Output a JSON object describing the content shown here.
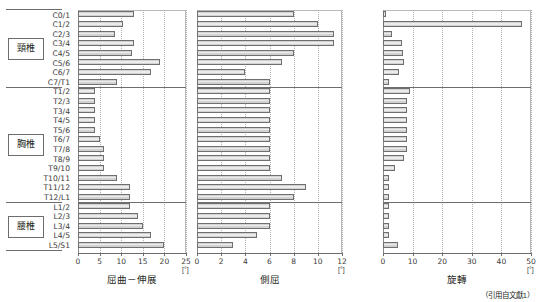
{
  "figure": {
    "citation": "（引用自文獻1）",
    "unit_symbol": "[°]"
  },
  "groups": [
    {
      "name": "cervical",
      "label": "頸椎"
    },
    {
      "name": "thoracic",
      "label": "胸椎"
    },
    {
      "name": "lumbar",
      "label": "腰椎"
    }
  ],
  "levels": [
    "C0/1",
    "C1/2",
    "C2/3",
    "C3/4",
    "C4/5",
    "C5/6",
    "C6/7",
    "C7/T1",
    "T1/2",
    "T2/3",
    "T3/4",
    "T4/5",
    "T5/6",
    "T6/7",
    "T7/8",
    "T8/9",
    "T9/10",
    "T10/11",
    "T11/12",
    "T12/L1",
    "L1/2",
    "L2/3",
    "L3/4",
    "L4/5",
    "L5/S1"
  ],
  "chart_data": [
    {
      "type": "bar",
      "orientation": "horizontal",
      "title": "屈曲－伸展",
      "xlabel": "屈曲－伸展",
      "ylabel": "",
      "unit": "[°]",
      "xlim": [
        0,
        25
      ],
      "xticks": [
        0,
        5,
        10,
        15,
        20,
        25
      ],
      "grid": true,
      "categories": [
        "C0/1",
        "C1/2",
        "C2/3",
        "C3/4",
        "C4/5",
        "C5/6",
        "C6/7",
        "C7/T1",
        "T1/2",
        "T2/3",
        "T3/4",
        "T4/5",
        "T5/6",
        "T6/7",
        "T7/8",
        "T8/9",
        "T9/10",
        "T10/11",
        "T11/12",
        "T12/L1",
        "L1/2",
        "L2/3",
        "L3/4",
        "L4/5",
        "L5/S1"
      ],
      "values": [
        13.0,
        10.5,
        8.5,
        13.0,
        12.5,
        19.0,
        17.0,
        9.0,
        4.0,
        4.0,
        4.0,
        4.0,
        4.0,
        5.0,
        6.0,
        6.0,
        6.0,
        9.0,
        12.0,
        12.0,
        12.0,
        14.0,
        15.0,
        17.0,
        20.0
      ]
    },
    {
      "type": "bar",
      "orientation": "horizontal",
      "title": "側屈",
      "xlabel": "側屈",
      "ylabel": "",
      "unit": "[°]",
      "xlim": [
        0,
        12
      ],
      "xticks": [
        0,
        2,
        4,
        6,
        8,
        10,
        12
      ],
      "grid": true,
      "categories": [
        "C0/1",
        "C1/2",
        "C2/3",
        "C3/4",
        "C4/5",
        "C5/6",
        "C6/7",
        "C7/T1",
        "T1/2",
        "T2/3",
        "T3/4",
        "T4/5",
        "T5/6",
        "T6/7",
        "T7/8",
        "T8/9",
        "T9/10",
        "T10/11",
        "T11/12",
        "T12/L1",
        "L1/2",
        "L2/3",
        "L3/4",
        "L4/5",
        "L5/S1"
      ],
      "values": [
        8.0,
        10.0,
        11.3,
        11.3,
        8.0,
        7.0,
        4.0,
        6.0,
        6.0,
        6.0,
        6.0,
        6.0,
        6.0,
        6.0,
        6.0,
        6.0,
        6.0,
        7.0,
        9.0,
        8.0,
        6.0,
        6.0,
        6.0,
        5.0,
        3.0
      ]
    },
    {
      "type": "bar",
      "orientation": "horizontal",
      "title": "旋轉",
      "xlabel": "旋轉",
      "ylabel": "",
      "unit": "[°]",
      "xlim": [
        0,
        50
      ],
      "xticks": [
        0,
        10,
        20,
        30,
        40,
        50
      ],
      "grid": true,
      "categories": [
        "C0/1",
        "C1/2",
        "C2/3",
        "C3/4",
        "C4/5",
        "C5/6",
        "C6/7",
        "C7/T1",
        "T1/2",
        "T2/3",
        "T3/4",
        "T4/5",
        "T5/6",
        "T6/7",
        "T7/8",
        "T8/9",
        "T9/10",
        "T10/11",
        "T11/12",
        "T12/L1",
        "L1/2",
        "L2/3",
        "L3/4",
        "L4/5",
        "L5/S1"
      ],
      "values": [
        1.0,
        47.0,
        3.0,
        6.5,
        6.8,
        7.0,
        5.4,
        2.0,
        9.0,
        8.0,
        8.0,
        8.0,
        8.0,
        8.0,
        8.0,
        7.0,
        4.0,
        2.0,
        2.0,
        2.0,
        2.0,
        2.0,
        2.0,
        2.0,
        5.0
      ]
    }
  ]
}
